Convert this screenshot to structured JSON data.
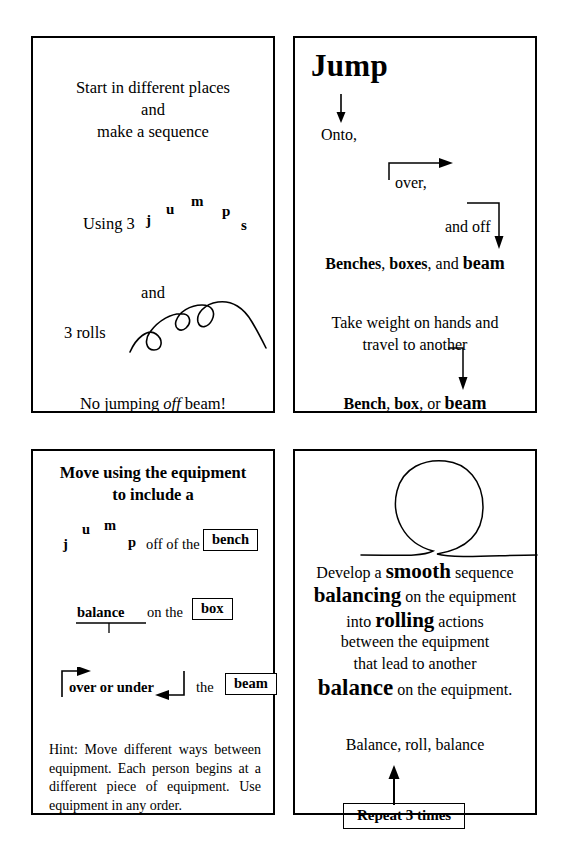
{
  "page": {
    "background": "#ffffff",
    "ink": "#000000"
  },
  "cards": {
    "top_left": {
      "name": "start-in-different-places-card",
      "heading_lines": [
        "Start in different places",
        "and",
        "make a sequence"
      ],
      "using_label": "Using 3",
      "arc_word_letters": [
        "j",
        "u",
        "m",
        "p",
        "s"
      ],
      "connector": "and",
      "rolls_label": "3 rolls",
      "rolls_icon": "three-loops-squiggle-icon",
      "footer_prefix": "No jumping ",
      "footer_emphasis": "off",
      "footer_suffix": " beam!"
    },
    "top_right": {
      "name": "jump-card",
      "title": "Jump",
      "down_arrow_icon": "down-arrow-icon",
      "onto_label": "Onto,",
      "over_label": "over,",
      "over_arrow_icon": "bracket-up-right-arrow-icon",
      "and_off_label": "and off",
      "and_off_arrow_icon": "bracket-up-right-down-arrow-icon",
      "equipment_line": {
        "item1": "Benches",
        "sep1": ", ",
        "item2": "boxes",
        "sep2": ", and ",
        "item3": "beam"
      },
      "instruction_lines": [
        "Take weight on hands and",
        "travel to another"
      ],
      "travel_arrow_icon": "hook-down-arrow-icon",
      "equipment_line2": {
        "item1": "Bench",
        "sep1": ", ",
        "item2": "box",
        "sep2": ", or ",
        "item3": "beam"
      }
    },
    "bottom_left": {
      "name": "move-using-equipment-card",
      "heading_lines": [
        "Move using the equipment",
        "to include a"
      ],
      "row1": {
        "arc_letters": [
          "j",
          "u",
          "m",
          "p"
        ],
        "text": "off of the",
        "equipment": "bench"
      },
      "row2": {
        "word": "balance",
        "balance_icon": "balance-beam-underline-icon",
        "text": "on the",
        "equipment": "box"
      },
      "row3": {
        "word": "over or under",
        "arrow_icon": "over-under-double-arrow-icon",
        "text": "the",
        "equipment": "beam"
      },
      "hint": "Hint: Move different ways between equipment. Each person begins at a different piece of equipment. Use equipment in any order."
    },
    "bottom_right": {
      "name": "smooth-sequence-card",
      "loop_icon": "vertical-loop-icon",
      "body_lines": [
        {
          "parts": [
            {
              "t": "Develop a ",
              "s": "normal"
            },
            {
              "t": "smooth",
              "s": "xl"
            },
            {
              "t": " sequence",
              "s": "normal"
            }
          ]
        },
        {
          "parts": [
            {
              "t": "balancing",
              "s": "xl"
            },
            {
              "t": " on the equipment",
              "s": "normal"
            }
          ]
        },
        {
          "parts": [
            {
              "t": "into ",
              "s": "normal"
            },
            {
              "t": "rolling",
              "s": "xl"
            },
            {
              "t": " actions",
              "s": "normal"
            }
          ]
        },
        {
          "parts": [
            {
              "t": "between the equipment",
              "s": "normal"
            }
          ]
        },
        {
          "parts": [
            {
              "t": "that lead to another",
              "s": "normal"
            }
          ]
        },
        {
          "parts": [
            {
              "t": "balance",
              "s": "xxl"
            },
            {
              "t": " on the equipment.",
              "s": "normal"
            }
          ]
        }
      ],
      "sequence_label": "Balance, roll, balance",
      "up_arrow_icon": "up-arrow-icon",
      "repeat_label": "Repeat 3 times"
    }
  }
}
